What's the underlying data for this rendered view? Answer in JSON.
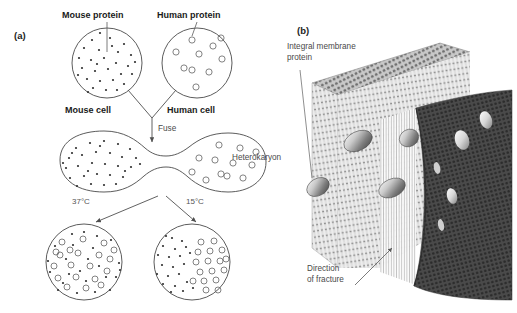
{
  "figure": {
    "background_color": "#ffffff",
    "width": 517,
    "height": 313
  },
  "panel_a": {
    "tag": "(a)",
    "title_implied": "Heterokaryon cell fusion experiment",
    "labels": {
      "mouse_protein": "Mouse protein",
      "human_protein": "Human protein",
      "mouse_cell": "Mouse cell",
      "human_cell": "Human cell",
      "fuse": "Fuse",
      "heterokaryon": "Heterokaryon",
      "temp_left": "37°C",
      "temp_right": "15°C"
    },
    "cells": {
      "mouse_cell": {
        "marker": "filled-dot",
        "marker_color": "#333333",
        "marker_count": 30,
        "cx": 107,
        "cy": 63,
        "r": 35
      },
      "human_cell": {
        "marker": "open-circle",
        "marker_color": "#555555",
        "marker_count": 10,
        "cx": 197,
        "cy": 63,
        "r": 35
      },
      "heterokaryon": {
        "shape": "dumbbell",
        "left_marker": "filled-dot",
        "right_marker": "open-circle",
        "left_marker_count": 32,
        "right_marker_count": 12
      },
      "result_37c": {
        "state": "intermixed",
        "cx": 84,
        "cy": 262,
        "r": 38,
        "dot_count": 24,
        "circle_count": 20
      },
      "result_15c": {
        "state": "segregated",
        "cx": 192,
        "cy": 262,
        "r": 38,
        "dot_count": 22,
        "circle_count": 17
      }
    },
    "colors": {
      "outline": "#4a4a4a",
      "arrow": "#555555",
      "dot": "#2f2f2f",
      "circle_stroke": "#6b6b6b"
    }
  },
  "panel_b": {
    "tag": "(b)",
    "labels": {
      "integral_membrane_protein_line1": "Integral membrane",
      "integral_membrane_protein_line2": "protein",
      "direction_line1": "Direction",
      "direction_line2": "of fracture"
    },
    "structure": {
      "description": "Freeze-fracture view of lipid bilayer with integral membrane proteins",
      "front_leaflet_color": "#e9e9e9",
      "fractured_leaflet_color": "#4d4d4d",
      "protein_particle_count": 4,
      "pit_count": 4,
      "top_face_color": "#b8b8b8"
    },
    "colors": {
      "leader_line": "#6a6a6a",
      "protein_highlight": "#f2f2f2",
      "protein_shadow": "#5a5a5a"
    }
  }
}
